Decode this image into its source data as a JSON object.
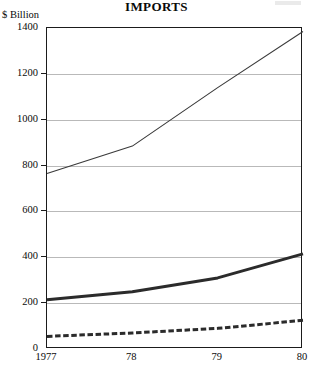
{
  "chart_data": {
    "type": "line",
    "title": "IMPORTS",
    "xlabel": "",
    "ylabel": "$ Billion",
    "y_axis_title": "$ Billion",
    "x": [
      1977,
      1978,
      1979,
      1980
    ],
    "categories": [
      "1977",
      "78",
      "79",
      "80"
    ],
    "xtick_labels": [
      "1977",
      "78",
      "79",
      "80"
    ],
    "ytick_labels": [
      "0",
      "200",
      "400",
      "600",
      "800",
      "1000",
      "1200",
      "1400"
    ],
    "ytick_values": [
      0,
      200,
      400,
      600,
      800,
      1000,
      1200,
      1400
    ],
    "ylim": [
      0,
      1400
    ],
    "xlim": [
      1977,
      1980
    ],
    "grid": true,
    "grid_axis": "y",
    "legend": "none",
    "series": [
      {
        "name": "total-imports",
        "style": "thin-solid",
        "color": "#3a3a3a",
        "width": 1.1,
        "values": [
          765,
          885,
          1140,
          1385
        ]
      },
      {
        "name": "middle-imports",
        "style": "thick-solid",
        "color": "#2b2b2b",
        "width": 3.0,
        "values": [
          215,
          250,
          310,
          415
        ]
      },
      {
        "name": "lower-imports",
        "style": "dashed",
        "color": "#2b2b2b",
        "width": 3.0,
        "values": [
          55,
          70,
          90,
          125
        ]
      }
    ]
  }
}
